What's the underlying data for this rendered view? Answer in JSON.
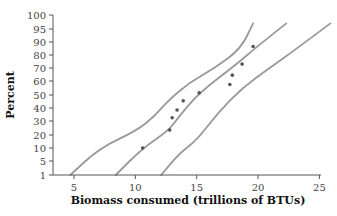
{
  "chart_data": {
    "type": "scatter",
    "title": "",
    "xlabel": "Biomass consumed (trillions of BTUs)",
    "ylabel": "Percent",
    "xlim": [
      3.4,
      25
    ],
    "x_ticks": [
      5,
      10,
      15,
      20,
      25
    ],
    "y_scale": "normal-probability",
    "y_ticks": [
      1,
      5,
      10,
      20,
      30,
      40,
      50,
      60,
      70,
      80,
      90,
      95,
      100
    ],
    "grid": false,
    "legend": null,
    "series": [
      {
        "name": "observations",
        "kind": "points",
        "color": "#555555",
        "points": [
          {
            "x": 10.6,
            "y": 10
          },
          {
            "x": 12.8,
            "y": 23.5
          },
          {
            "x": 13.0,
            "y": 32.5
          },
          {
            "x": 13.4,
            "y": 38.5
          },
          {
            "x": 13.9,
            "y": 45.5
          },
          {
            "x": 15.2,
            "y": 51.5
          },
          {
            "x": 17.7,
            "y": 57.5
          },
          {
            "x": 17.9,
            "y": 64.5
          },
          {
            "x": 18.7,
            "y": 73
          },
          {
            "x": 19.6,
            "y": 86.5
          }
        ]
      },
      {
        "name": "fitted line",
        "kind": "line",
        "color": "#999999",
        "points": [
          {
            "x": 8.4,
            "y": 1
          },
          {
            "x": 10.6,
            "y": 10
          },
          {
            "x": 12.7,
            "y": 23
          },
          {
            "x": 13.6,
            "y": 34
          },
          {
            "x": 15.2,
            "y": 51.5
          },
          {
            "x": 18.4,
            "y": 74
          },
          {
            "x": 19.6,
            "y": 84
          },
          {
            "x": 22.3,
            "y": 97
          }
        ]
      },
      {
        "name": "lower confidence band",
        "kind": "line",
        "color": "#999999",
        "points": [
          {
            "x": 4.7,
            "y": 1
          },
          {
            "x": 7.1,
            "y": 10
          },
          {
            "x": 10.1,
            "y": 23
          },
          {
            "x": 11.6,
            "y": 34
          },
          {
            "x": 12.6,
            "y": 45
          },
          {
            "x": 14.4,
            "y": 59
          },
          {
            "x": 16.5,
            "y": 70
          },
          {
            "x": 18.6,
            "y": 85
          },
          {
            "x": 19.6,
            "y": 97
          }
        ]
      },
      {
        "name": "upper confidence band",
        "kind": "line",
        "color": "#999999",
        "points": [
          {
            "x": 12.1,
            "y": 1
          },
          {
            "x": 13.6,
            "y": 8
          },
          {
            "x": 15.0,
            "y": 16
          },
          {
            "x": 16.7,
            "y": 36
          },
          {
            "x": 18.7,
            "y": 55
          },
          {
            "x": 21.1,
            "y": 71
          },
          {
            "x": 23.0,
            "y": 84
          },
          {
            "x": 25.9,
            "y": 97
          }
        ]
      }
    ]
  },
  "axes": {
    "x_title": "Biomass consumed (trillions of BTUs)",
    "y_title": "Percent"
  }
}
